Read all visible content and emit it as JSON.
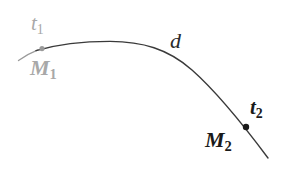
{
  "figure": {
    "background_color": "#ffffff",
    "width": 284,
    "height": 179,
    "curve": {
      "name": "trajectory-arc",
      "color": "#3a3a3a",
      "stroke_width": 1.4,
      "left_tail_color": "#9a9a9a"
    },
    "points": [
      {
        "id": "m1",
        "color": "#9a9a9a",
        "radius": 2.6,
        "x": 42,
        "y": 48,
        "top_label": "t",
        "top_sub": "1",
        "bottom_label": "M",
        "bottom_sub": "1"
      },
      {
        "id": "m2",
        "color": "#1a1a1a",
        "radius": 3.2,
        "x": 246,
        "y": 127,
        "top_label": "t",
        "top_sub": "2",
        "bottom_label": "M",
        "bottom_sub": "2"
      }
    ],
    "arc_label": "d"
  }
}
